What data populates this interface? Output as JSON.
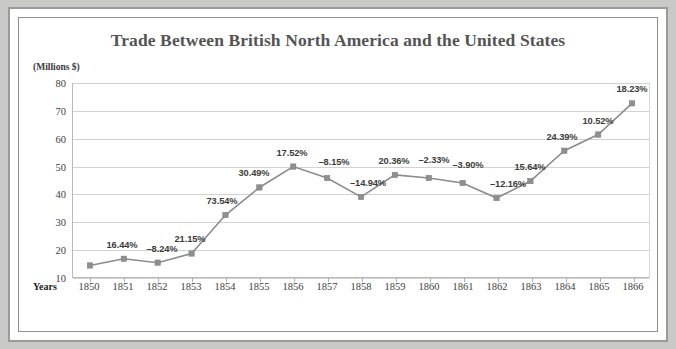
{
  "chart_data": {
    "type": "line",
    "title": "Trade Between British North America and the United States",
    "ylabel": "(Millions $)",
    "xlabel": "Years",
    "categories": [
      "1850",
      "1851",
      "1852",
      "1853",
      "1854",
      "1855",
      "1856",
      "1857",
      "1858",
      "1859",
      "1860",
      "1861",
      "1862",
      "1863",
      "1864",
      "1865",
      "1866"
    ],
    "values": [
      14.5,
      16.9,
      15.5,
      18.8,
      32.6,
      42.5,
      50.0,
      45.9,
      39.1,
      47.0,
      45.9,
      44.1,
      38.7,
      44.8,
      55.7,
      61.5,
      72.7
    ],
    "point_labels": [
      "",
      "16.44%",
      "–8.24%",
      "21.15%",
      "73.54%",
      "30.49%",
      "17.52%",
      "–8.15%",
      "–14.94%",
      "20.36%",
      "–2.33%",
      "–3.90%",
      "–12.16%",
      "15.64%",
      "24.39%",
      "10.52%",
      "18.23%"
    ],
    "yticks": [
      80,
      70,
      60,
      50,
      40,
      30,
      20,
      10
    ],
    "ylim": [
      10,
      80
    ],
    "grid": true,
    "legend": "none",
    "annotation_note": "Data labels show year-over-year percent change",
    "colors": {
      "line": "#8c8c8c",
      "marker": "#8f8f8f",
      "grid": "#d2d2d2",
      "title": "#545454",
      "frame": "#9a9a98",
      "background": "#ffffff"
    }
  }
}
